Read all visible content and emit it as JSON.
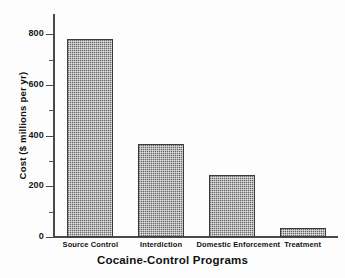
{
  "chart_data": {
    "type": "bar",
    "title": "",
    "xlabel": "Cocaine-Control Programs",
    "ylabel": "Cost ($ millions per yr)",
    "categories": [
      "Source Control",
      "Interdiction",
      "Domestic Enforcement",
      "Treatment"
    ],
    "values": [
      783,
      366,
      246,
      34
    ],
    "ylim": [
      0,
      880
    ],
    "ytick_labels": [
      "0",
      "200",
      "400",
      "600",
      "800"
    ],
    "ytick_values": [
      0,
      200,
      400,
      600,
      800
    ],
    "yminor_values": [
      100,
      300,
      500,
      700
    ],
    "grid": false,
    "legend": null,
    "bar_fill": "#9a9a9a",
    "bar_edge": "#3a3a3a",
    "axis_color": "#4a4a4a",
    "background": "#fdfdfd"
  },
  "figure": {
    "name": "cocaine-control-programs-cost-bar-chart"
  }
}
